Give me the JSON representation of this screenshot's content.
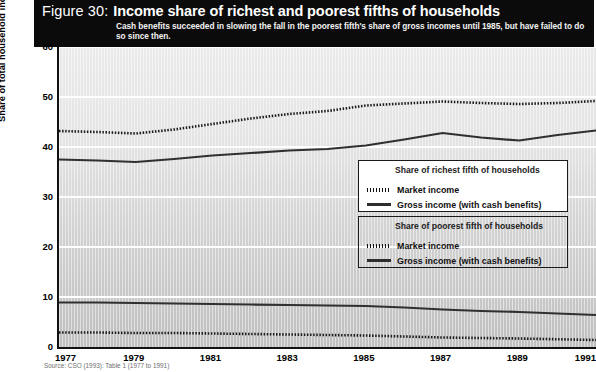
{
  "figure": {
    "number_label": "Figure 30:",
    "title": "Income share of richest and poorest fifths of households",
    "subtitle": "Cash benefits succeeded in slowing the fall in the poorest fifth's share of gross incomes until 1985, but have failed to do so since then.",
    "source": "Source: CSO (1993): Table 1 (1977 to 1991)"
  },
  "legends": [
    {
      "id": "richest",
      "heading": "Share of richest fifth of households",
      "rows": [
        {
          "marker": "dotted",
          "label": "Market income"
        },
        {
          "marker": "solid",
          "label": "Gross income (with cash benefits)"
        }
      ]
    },
    {
      "id": "poorest",
      "heading": "Share of poorest fifth of households",
      "rows": [
        {
          "marker": "dotted",
          "label": "Market income"
        },
        {
          "marker": "solid",
          "label": "Gross income (with cash benefits)"
        }
      ]
    }
  ],
  "chart_data": {
    "type": "line",
    "title": "Income share of richest and poorest fifths of households",
    "subtitle": "Cash benefits succeeded in slowing the fall in the poorest fifth's share of gross incomes until 1985, but have failed to do so since then.",
    "xlabel": "",
    "ylabel": "Share of total household income (%)",
    "x": [
      1977,
      1978,
      1979,
      1980,
      1981,
      1982,
      1983,
      1984,
      1985,
      1986,
      1987,
      1988,
      1989,
      1990,
      1991
    ],
    "xlim": [
      1977,
      1991
    ],
    "ylim": [
      0,
      60
    ],
    "yticks": [
      0,
      10,
      20,
      30,
      40,
      50,
      60
    ],
    "ytick_labels": [
      "0",
      "10",
      "20",
      "30",
      "40",
      "50",
      "60"
    ],
    "xticks": [
      1977,
      1979,
      1981,
      1983,
      1985,
      1987,
      1989,
      1991
    ],
    "xtick_labels": [
      "1977",
      "1979",
      "1981",
      "1983",
      "1985",
      "1987",
      "1989",
      "1991"
    ],
    "grid": "horizontal",
    "legend_position": "center-right",
    "series": [
      {
        "name": "Richest fifth - Market income",
        "group": "richest",
        "style": "dotted",
        "values": [
          43.2,
          43.0,
          42.7,
          43.5,
          44.6,
          45.7,
          46.6,
          47.2,
          48.3,
          48.7,
          49.1,
          48.8,
          48.6,
          48.8,
          49.2
        ]
      },
      {
        "name": "Richest fifth - Gross income (with cash benefits)",
        "group": "richest",
        "style": "solid",
        "values": [
          37.5,
          37.3,
          37.0,
          37.6,
          38.3,
          38.8,
          39.3,
          39.6,
          40.3,
          41.5,
          42.8,
          41.9,
          41.3,
          42.4,
          43.3
        ]
      },
      {
        "name": "Poorest fifth - Gross income (with cash benefits)",
        "group": "poorest",
        "style": "solid",
        "values": [
          8.9,
          8.9,
          8.8,
          8.7,
          8.6,
          8.5,
          8.4,
          8.3,
          8.2,
          7.9,
          7.5,
          7.2,
          7.0,
          6.7,
          6.4
        ]
      },
      {
        "name": "Poorest fifth - Market income",
        "group": "poorest",
        "style": "dotted",
        "values": [
          2.9,
          2.9,
          2.8,
          2.8,
          2.7,
          2.6,
          2.5,
          2.4,
          2.3,
          2.1,
          1.9,
          1.8,
          1.7,
          1.55,
          1.4
        ]
      }
    ]
  }
}
